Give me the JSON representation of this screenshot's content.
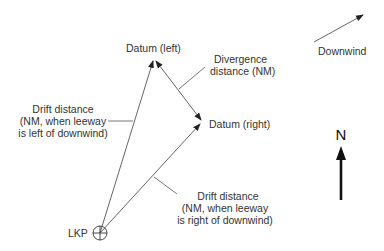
{
  "diagram": {
    "labels": {
      "datum_left": "Datum (left)",
      "datum_right": "Datum (right)",
      "divergence_line1": "Divergence",
      "divergence_line2": "distance (NM)",
      "drift_left_line1": "Drift distance",
      "drift_left_line2": "(NM, when leeway",
      "drift_left_line3": "is left of downwind)",
      "drift_right_line1": "Drift distance",
      "drift_right_line2": "(NM, when leeway",
      "drift_right_line3": "is right of downwind)",
      "lkp": "LKP",
      "downwind": "Downwind",
      "north": "N"
    },
    "colors": {
      "line": "#555555",
      "text": "#333333",
      "north_arrow": "#111111"
    }
  }
}
